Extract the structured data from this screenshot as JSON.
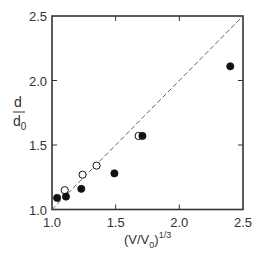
{
  "chart_data": {
    "type": "scatter",
    "title": "",
    "xlabel": "(V/V0)^1/3",
    "ylabel": "d/d0",
    "xlabel_parts": {
      "open": "(V/V",
      "sub": "0",
      "close": ")",
      "sup": "1/3"
    },
    "ylabel_parts": {
      "num": "d",
      "den": "d",
      "den_sub": "0"
    },
    "xlim": [
      1.0,
      2.5
    ],
    "ylim": [
      1.0,
      2.5
    ],
    "xticks": [
      "1.0",
      "1.5",
      "2.0",
      "2.5"
    ],
    "yticks": [
      "1.0",
      "1.5",
      "2.0",
      "2.5"
    ],
    "grid": false,
    "legend": null,
    "series": [
      {
        "name": "open circles",
        "marker": "open-circle",
        "x": [
          1.1,
          1.24,
          1.35,
          1.68
        ],
        "y": [
          1.15,
          1.27,
          1.34,
          1.57
        ]
      },
      {
        "name": "filled circles",
        "marker": "filled-circle",
        "x": [
          1.04,
          1.11,
          1.23,
          1.49,
          1.71,
          2.4
        ],
        "y": [
          1.09,
          1.1,
          1.16,
          1.28,
          1.57,
          2.11
        ]
      }
    ],
    "reference_line": {
      "style": "dashed",
      "label": "y = x",
      "x": [
        1.0,
        2.5
      ],
      "y": [
        1.0,
        2.5
      ]
    }
  },
  "colors": {
    "axis": "#333333",
    "marker": "#111111",
    "dash": "#555555",
    "background": "#ffffff"
  }
}
